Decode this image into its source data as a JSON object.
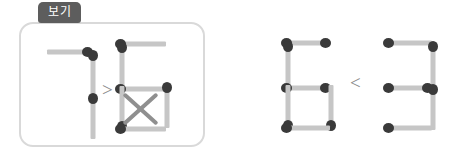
{
  "example_box": {
    "tab_label": "보기",
    "border_color": "#d9d9d9",
    "tab_color": "#5d5d5d"
  },
  "colors": {
    "match_head": "#3a3a3a",
    "match_body": "#c6c6c6",
    "operator": "#8a8a8a",
    "cross_mark": "#8f8f8f",
    "background": "#ffffff"
  },
  "expressions": [
    {
      "id": "example-expression",
      "inside_box": true,
      "left_digit": "7",
      "operator": ">",
      "right_digit": "5",
      "has_cross_mark": true,
      "cross_mark_label": "X"
    },
    {
      "id": "problem-expression",
      "inside_box": false,
      "left_digit": "6",
      "operator": "<",
      "right_digit": "3",
      "has_cross_mark": false,
      "cross_mark_label": ""
    }
  ],
  "operators": {
    "greater_than": ">",
    "less_than": "<"
  },
  "digits": {
    "seven": "7",
    "five": "5",
    "six": "6",
    "three": "3"
  }
}
